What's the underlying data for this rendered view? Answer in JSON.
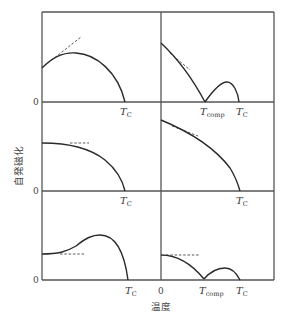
{
  "figure": {
    "ylabel": "自発磁化",
    "xlabel": "温度",
    "zero_label": "0",
    "tc_main": "T",
    "tc_sub": "C",
    "tcomp_main": "T",
    "tcomp_sub": "comp"
  },
  "panels": [
    {
      "id": "row1-left",
      "shape": "rises from nonzero value with positive initial slope (dashed tangent upward), peaks, falls to zero at Tc",
      "labels": [
        "T_C"
      ]
    },
    {
      "id": "row1-right",
      "shape": "decreases linearly (dashed tangent) to zero at T_comp, rises to small hump, returns to zero at T_C",
      "labels": [
        "T_comp",
        "T_C"
      ]
    },
    {
      "id": "row2-left",
      "shape": "flat start (horizontal dashed tangent), standard Brillouin-like decay to zero at T_C",
      "labels": [
        "T_C"
      ]
    },
    {
      "id": "row2-right",
      "shape": "monotonic decrease with negative initial slope (dashed tangent) to zero at T_C",
      "labels": [
        "T_C"
      ]
    },
    {
      "id": "row3-left",
      "shape": "flat start (horizontal dashed tangent), rises to maximum, drops to zero at T_C",
      "labels": [
        "T_C"
      ]
    },
    {
      "id": "row3-right",
      "shape": "flat start (horizontal dashed), decreases to zero at T_comp, small hump, zero at T_C",
      "labels": [
        "T_comp",
        "T_C"
      ]
    }
  ],
  "colors": {
    "frame": "#555555",
    "curve": "#2a2a2a",
    "background": "#ffffff"
  }
}
